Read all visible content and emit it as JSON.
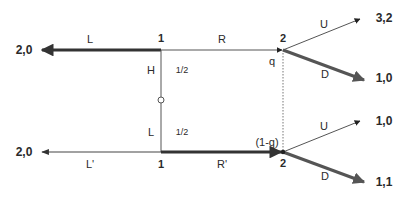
{
  "diagram": {
    "type": "extensive-form-game-tree",
    "colors": {
      "thin_line": "#555555",
      "thick_line": "#333333",
      "thick_line_right": "#555555",
      "text": "#2a2a2a",
      "background": "#ffffff"
    },
    "chance_node": {
      "labels": {
        "high": "H",
        "low": "L"
      },
      "probabilities": {
        "high": "1/2",
        "low": "1/2"
      }
    },
    "top_branch": {
      "player1_label": "1",
      "left_action": "L",
      "right_action": "R",
      "left_payoff": "2,0",
      "player2_label": "2",
      "belief": "q",
      "up_action": "U",
      "down_action": "D",
      "up_payoff": "3,2",
      "down_payoff": "1,0"
    },
    "bottom_branch": {
      "player1_label": "1",
      "left_action": "L'",
      "right_action": "R'",
      "left_payoff": "2,0",
      "player2_label": "2",
      "belief": "(1-q)",
      "up_action": "U",
      "down_action": "D",
      "up_payoff": "1,0",
      "down_payoff": "1,1"
    }
  }
}
